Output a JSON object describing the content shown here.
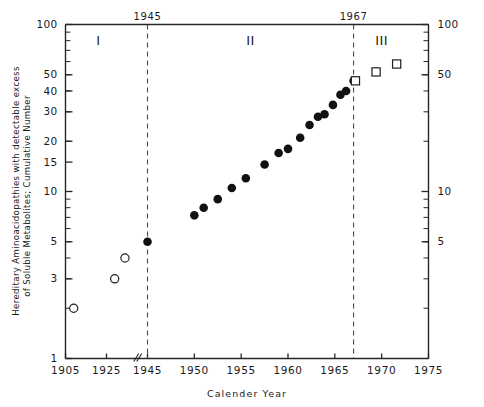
{
  "chart_data": {
    "type": "scatter",
    "title": "",
    "xlabel": "Calender Year",
    "ylabel": "Hereditary Aminoacidopathies with detectable excess of Soluble Metabolites; Cumulative Number",
    "ylabel_line1": "Hereditary Aminoacidopathies with detectable excess",
    "ylabel_line2": "of Soluble Metabolites; Cumulative Number",
    "yscale": "log",
    "ylim": [
      1,
      100
    ],
    "xlim": [
      1905,
      1975
    ],
    "grid": false,
    "legend": "none",
    "axis_break_x": 1940,
    "ytick_labels_left": [
      "100",
      "50",
      "40",
      "30",
      "20",
      "15",
      "10",
      "5",
      "3",
      "1"
    ],
    "ytick_values_left": [
      100,
      50,
      40,
      30,
      20,
      15,
      10,
      5,
      3,
      1
    ],
    "ytick_labels_right": [
      "100",
      "50",
      "10",
      "5"
    ],
    "ytick_values_right": [
      100,
      50,
      10,
      5
    ],
    "xtick_labels": [
      "1905",
      "1925",
      "1945",
      "1950",
      "1955",
      "1960",
      "1965",
      "1970",
      "1975"
    ],
    "xtick_values": [
      1905,
      1925,
      1945,
      1950,
      1955,
      1960,
      1965,
      1970,
      1975
    ],
    "period_dividers": [
      {
        "label": "1945",
        "value": 1945
      },
      {
        "label": "1967",
        "value": 1967
      }
    ],
    "period_labels": [
      {
        "label": "I",
        "x": 1921
      },
      {
        "label": "II",
        "x": 1956
      },
      {
        "label": "III",
        "x": 1970
      }
    ],
    "series": [
      {
        "name": "Period I open circles",
        "marker": "open-circle",
        "points": [
          {
            "x": 1909,
            "y": 2
          },
          {
            "x": 1929,
            "y": 3
          },
          {
            "x": 1934,
            "y": 4
          }
        ]
      },
      {
        "name": "Period II filled circles",
        "marker": "filled-circle",
        "points": [
          {
            "x": 1945,
            "y": 5
          },
          {
            "x": 1950,
            "y": 7.2
          },
          {
            "x": 1951,
            "y": 8
          },
          {
            "x": 1952.5,
            "y": 9
          },
          {
            "x": 1954,
            "y": 10.5
          },
          {
            "x": 1955.5,
            "y": 12
          },
          {
            "x": 1957.5,
            "y": 14.5
          },
          {
            "x": 1959,
            "y": 17
          },
          {
            "x": 1960,
            "y": 18
          },
          {
            "x": 1961.3,
            "y": 21
          },
          {
            "x": 1962.3,
            "y": 25
          },
          {
            "x": 1963.2,
            "y": 28
          },
          {
            "x": 1963.9,
            "y": 29
          },
          {
            "x": 1964.8,
            "y": 33
          },
          {
            "x": 1965.6,
            "y": 38
          },
          {
            "x": 1966.2,
            "y": 40
          },
          {
            "x": 1967,
            "y": 46
          }
        ]
      },
      {
        "name": "Period III open squares",
        "marker": "open-square",
        "points": [
          {
            "x": 1967.2,
            "y": 46
          },
          {
            "x": 1969.4,
            "y": 52
          },
          {
            "x": 1971.6,
            "y": 58
          }
        ]
      }
    ]
  }
}
